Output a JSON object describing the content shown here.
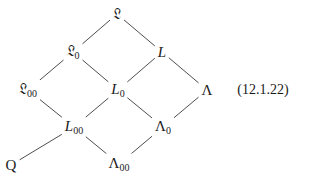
{
  "diagram": {
    "equation_number": "(12.1.22)",
    "nodes": [
      {
        "id": "frakL",
        "base": "𝔏",
        "sub": "",
        "style": "fraktur"
      },
      {
        "id": "frakL0",
        "base": "𝔏",
        "sub": "0",
        "style": "fraktur"
      },
      {
        "id": "L",
        "base": "L",
        "sub": "",
        "style": "italic"
      },
      {
        "id": "frakL00",
        "base": "𝔏",
        "sub": "00",
        "style": "fraktur"
      },
      {
        "id": "L0",
        "base": "L",
        "sub": "0",
        "style": "italic"
      },
      {
        "id": "Lambda",
        "base": "Λ",
        "sub": "",
        "style": "upright"
      },
      {
        "id": "L00",
        "base": "L",
        "sub": "00",
        "style": "italic"
      },
      {
        "id": "Lambda0",
        "base": "Λ",
        "sub": "0",
        "style": "upright"
      },
      {
        "id": "Lambda00",
        "base": "Λ",
        "sub": "00",
        "style": "upright"
      },
      {
        "id": "Q",
        "base": "Q",
        "sub": "",
        "style": "upright"
      }
    ],
    "edges": [
      [
        "frakL",
        "frakL0"
      ],
      [
        "frakL",
        "L"
      ],
      [
        "frakL0",
        "frakL00"
      ],
      [
        "frakL0",
        "L0"
      ],
      [
        "L",
        "L0"
      ],
      [
        "L",
        "Lambda"
      ],
      [
        "frakL00",
        "L00"
      ],
      [
        "L0",
        "L00"
      ],
      [
        "L0",
        "Lambda0"
      ],
      [
        "Lambda",
        "Lambda0"
      ],
      [
        "L00",
        "Lambda00"
      ],
      [
        "Lambda0",
        "Lambda00"
      ],
      [
        "L00",
        "Q"
      ]
    ]
  }
}
